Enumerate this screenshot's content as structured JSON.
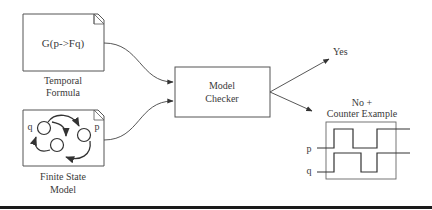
{
  "diagram": {
    "temporal_formula": {
      "formula": "G(p->Fq)",
      "caption_line1": "Temporal",
      "caption_line2": "Formula"
    },
    "finite_state_model": {
      "state_labels": [
        "q",
        "p"
      ],
      "caption_line1": "Finite State",
      "caption_line2": "Model"
    },
    "model_checker": {
      "line1": "Model",
      "line2": "Checker"
    },
    "outputs": {
      "yes_label": "Yes",
      "no_line1": "No +",
      "no_line2": "Counter Example"
    },
    "counter_example": {
      "signals": [
        "p",
        "q"
      ]
    },
    "colors": {
      "stroke": "#555555",
      "bottom_bar": "#1a1a1a"
    }
  }
}
